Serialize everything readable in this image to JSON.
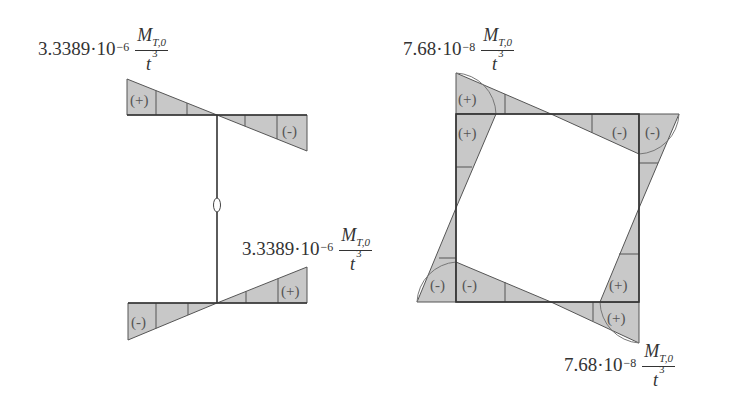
{
  "labels": {
    "left_top": {
      "coefficient": "3.3389·10",
      "exponent": "−6",
      "numerator": "M",
      "numerator_sub": "T,0",
      "denominator": "t",
      "denominator_exp": "3"
    },
    "left_bottom": {
      "coefficient": "3.3389·10",
      "exponent": "−6",
      "numerator": "M",
      "numerator_sub": "T,0",
      "denominator": "t",
      "denominator_exp": "3"
    },
    "right_top": {
      "coefficient": "7.68·10",
      "exponent": "−8",
      "numerator": "M",
      "numerator_sub": "T,0",
      "denominator": "t",
      "denominator_exp": "3"
    },
    "right_bottom": {
      "coefficient": "7.68·10",
      "exponent": "−8",
      "numerator": "M",
      "numerator_sub": "T,0",
      "denominator": "t",
      "denominator_exp": "3"
    }
  },
  "signs": {
    "plus": "(+)",
    "minus": "(-)",
    "zero": "0"
  },
  "colors": {
    "fill": "#c8c8c8",
    "stroke": "#555555",
    "text": "#333333"
  }
}
